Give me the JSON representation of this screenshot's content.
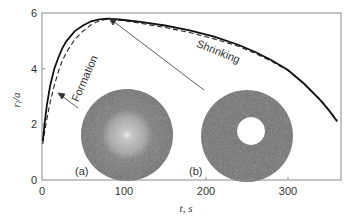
{
  "chart_data": {
    "type": "line",
    "title": "",
    "xlabel": "t, s",
    "ylabel": "r_l/a",
    "xlim": [
      0,
      400
    ],
    "ylim": [
      0,
      6
    ],
    "x_ticks": [
      0,
      100,
      200,
      300
    ],
    "y_ticks": [
      0,
      2,
      4,
      6
    ],
    "grid": false,
    "legend": null,
    "series": [
      {
        "name": "simulation (solid)",
        "style": "solid",
        "x": [
          1,
          3,
          6,
          10,
          15,
          20,
          25,
          30,
          40,
          50,
          60,
          70,
          80,
          90,
          100,
          120,
          150,
          180,
          210,
          240,
          260,
          280,
          300,
          320,
          340,
          350,
          360
        ],
        "y": [
          1.4,
          2.0,
          2.7,
          3.4,
          4.0,
          4.4,
          4.75,
          5.0,
          5.35,
          5.55,
          5.7,
          5.77,
          5.8,
          5.78,
          5.75,
          5.68,
          5.55,
          5.38,
          5.15,
          4.85,
          4.6,
          4.3,
          3.95,
          3.45,
          2.85,
          2.5,
          2.1
        ]
      },
      {
        "name": "theory (dashed)",
        "style": "dashed",
        "x": [
          1,
          3,
          6,
          10,
          15,
          20,
          25,
          30,
          40,
          50,
          60,
          70,
          80,
          90,
          100,
          120,
          150,
          180,
          210,
          240,
          260,
          280,
          300,
          320,
          340,
          350,
          360
        ],
        "y": [
          1.3,
          1.7,
          2.2,
          2.8,
          3.4,
          3.9,
          4.3,
          4.6,
          5.05,
          5.35,
          5.58,
          5.72,
          5.78,
          5.76,
          5.72,
          5.63,
          5.48,
          5.3,
          5.07,
          4.8,
          4.55,
          4.27,
          3.93,
          3.45,
          2.87,
          2.5,
          2.15
        ]
      }
    ],
    "annotations": [
      {
        "text": "Formation",
        "x": 18,
        "y": 4.0,
        "rotation": -70
      },
      {
        "text": "Shrinking",
        "x": 190,
        "y": 5.0,
        "rotation": 25
      },
      {
        "text": "(a)",
        "x": 75,
        "y": 0.4
      },
      {
        "text": "(b)",
        "x": 185,
        "y": 0.4
      }
    ],
    "insets": [
      {
        "label": "(a)",
        "description": "filled disc with lighter core"
      },
      {
        "label": "(b)",
        "description": "ring (annulus) with empty core"
      }
    ]
  },
  "labels": {
    "x_axis": "t, s",
    "y_axis_main": "r",
    "y_axis_sub": "l",
    "y_axis_rest": "/a",
    "formation": "Formation",
    "shrinking": "Shrinking",
    "inset_a": "(a)",
    "inset_b": "(b)",
    "xt0": "0",
    "xt1": "100",
    "xt2": "200",
    "xt3": "300",
    "yt0": "0",
    "yt1": "2",
    "yt2": "4",
    "yt3": "6"
  },
  "colors": {
    "frame": "#888888",
    "curve": "#111111",
    "inset_dark": "#6e6e6e",
    "inset_light": "#b8b8b8"
  }
}
